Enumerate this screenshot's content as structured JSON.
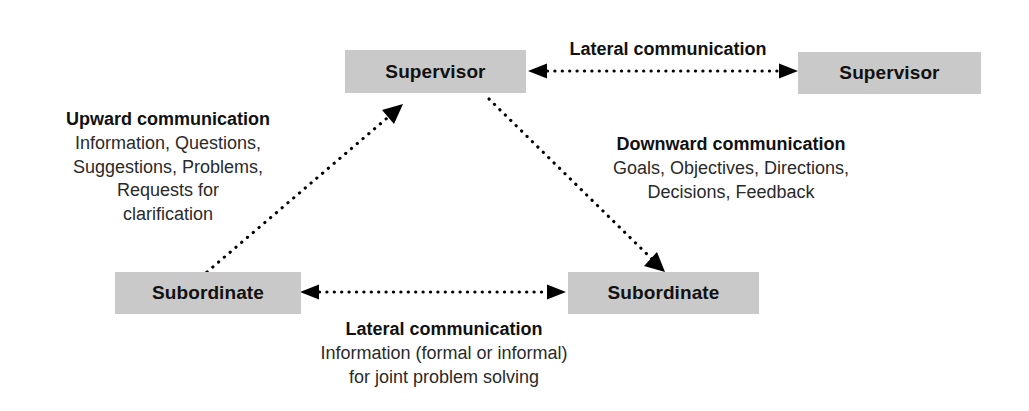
{
  "diagram": {
    "background_color": "#ffffff",
    "box_fill_color": "#c9c9c9",
    "text_color": "#111111",
    "arrow_color": "#000000",
    "arrow_style": "dotted"
  },
  "nodes": {
    "supervisor_left": {
      "label": "Supervisor"
    },
    "supervisor_right": {
      "label": "Supervisor"
    },
    "subordinate_left": {
      "label": "Subordinate"
    },
    "subordinate_right": {
      "label": "Subordinate"
    }
  },
  "labels": {
    "lateral_top": {
      "title": "Lateral communication",
      "lines": []
    },
    "upward": {
      "title": "Upward communication",
      "lines": [
        "Information, Questions,",
        "Suggestions, Problems,",
        "Requests for",
        "clarification"
      ]
    },
    "downward": {
      "title": "Downward communication",
      "lines": [
        "Goals, Objectives, Directions,",
        "Decisions, Feedback"
      ]
    },
    "lateral_bottom": {
      "title": "Lateral communication",
      "lines": [
        "Information (formal or informal)",
        "for joint problem solving"
      ]
    }
  },
  "connectors": {
    "lateral_top": {
      "from": "supervisor_left",
      "to": "supervisor_right",
      "direction": "bidirectional"
    },
    "lateral_bottom": {
      "from": "subordinate_left",
      "to": "subordinate_right",
      "direction": "bidirectional"
    },
    "upward": {
      "from": "subordinate_left",
      "to": "supervisor_left",
      "direction": "single"
    },
    "downward": {
      "from": "supervisor_left",
      "to": "subordinate_right",
      "direction": "single"
    }
  }
}
